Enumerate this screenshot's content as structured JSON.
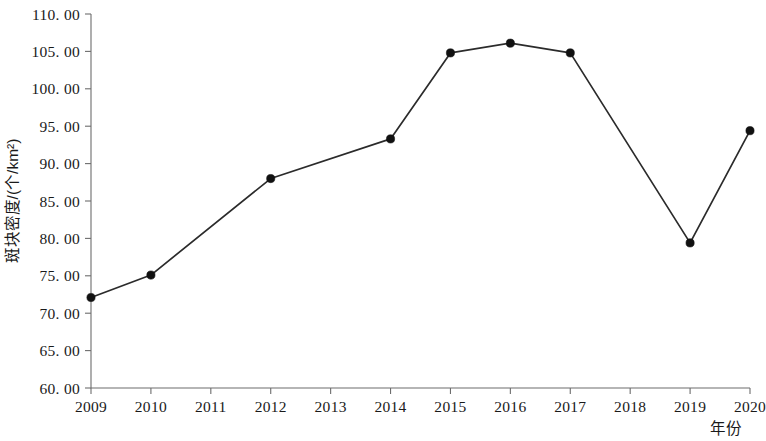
{
  "chart_data": {
    "type": "line",
    "title": "",
    "xlabel": "年份",
    "ylabel": "斑块密度/(个/km²)",
    "categories": [
      "2009",
      "2010",
      "2011",
      "2012",
      "2013",
      "2014",
      "2015",
      "2016",
      "2017",
      "2018",
      "2019",
      "2020"
    ],
    "x": [
      2009,
      2010,
      2011,
      2012,
      2013,
      2014,
      2015,
      2016,
      2017,
      2018,
      2019,
      2020
    ],
    "values": [
      72.1,
      75.1,
      null,
      88.0,
      null,
      93.3,
      104.8,
      106.1,
      104.8,
      null,
      79.4,
      94.4
    ],
    "series": [
      {
        "name": "斑块密度",
        "points": [
          {
            "x": "2009",
            "y": 72.1,
            "marker": true
          },
          {
            "x": "2010",
            "y": 75.1,
            "marker": true
          },
          {
            "x": "2012",
            "y": 88.0,
            "marker": true
          },
          {
            "x": "2014",
            "y": 93.3,
            "marker": true
          },
          {
            "x": "2015",
            "y": 104.8,
            "marker": true
          },
          {
            "x": "2016",
            "y": 106.1,
            "marker": true
          },
          {
            "x": "2017",
            "y": 104.8,
            "marker": true
          },
          {
            "x": "2019",
            "y": 79.4,
            "marker": true
          },
          {
            "x": "2020",
            "y": 94.4,
            "marker": true
          }
        ],
        "color": "#2b2b2b",
        "marker_style": "filled-circle"
      }
    ],
    "xlim": [
      2009,
      2020
    ],
    "ylim": [
      60.0,
      110.0
    ],
    "ytick_labels": [
      "110. 00",
      "105. 00",
      "100. 00",
      "95. 00",
      "90. 00",
      "85. 00",
      "80. 00",
      "75. 00",
      "70. 00",
      "65. 00",
      "60. 00"
    ],
    "ytick_values": [
      110,
      105,
      100,
      95,
      90,
      85,
      80,
      75,
      70,
      65,
      60
    ],
    "xtick_labels": [
      "2009",
      "2010",
      "2011",
      "2012",
      "2013",
      "2014",
      "2015",
      "2016",
      "2017",
      "2018",
      "2019",
      "2020"
    ],
    "grid": false,
    "legend": false,
    "legend_position": "none",
    "spines": [
      "left",
      "bottom"
    ]
  }
}
